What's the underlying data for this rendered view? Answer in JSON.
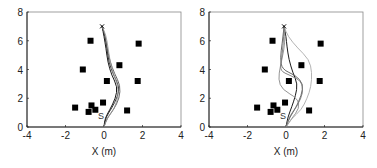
{
  "chart_data": [
    {
      "type": "scatter",
      "title": "",
      "xlabel": "X (m)",
      "ylabel": "",
      "xlim": [
        -4,
        4
      ],
      "ylim": [
        0,
        8
      ],
      "xticks": [
        -4,
        -2,
        0,
        2,
        4
      ],
      "yticks": [
        0,
        2,
        4,
        6,
        8
      ],
      "grid": false,
      "obstacles": [
        [
          -0.7,
          6.0
        ],
        [
          1.8,
          5.8
        ],
        [
          -1.1,
          4.0
        ],
        [
          0.8,
          4.3
        ],
        [
          0.15,
          3.2
        ],
        [
          1.75,
          3.2
        ],
        [
          -0.05,
          1.7
        ],
        [
          -0.65,
          1.5
        ],
        [
          -0.45,
          1.2
        ],
        [
          -1.5,
          1.35
        ],
        [
          -0.8,
          1.05
        ],
        [
          1.2,
          1.15
        ]
      ],
      "goal": {
        "marker": "x",
        "x": -0.1,
        "y": 7.0
      },
      "start": {
        "label": "S",
        "x": 0.0,
        "y": 0.8
      },
      "trajectories": [
        {
          "color": "#000000",
          "points": [
            [
              0,
              0
            ],
            [
              0.05,
              0.6
            ],
            [
              0.3,
              1.2
            ],
            [
              0.6,
              2.0
            ],
            [
              0.7,
              2.8
            ],
            [
              0.4,
              3.6
            ],
            [
              0.2,
              4.5
            ],
            [
              0.1,
              5.5
            ],
            [
              0,
              6.3
            ],
            [
              -0.1,
              7.0
            ]
          ]
        },
        {
          "color": "#222222",
          "points": [
            [
              0,
              0
            ],
            [
              0.1,
              0.7
            ],
            [
              0.4,
              1.3
            ],
            [
              0.7,
              2.1
            ],
            [
              0.8,
              2.8
            ],
            [
              0.5,
              3.6
            ],
            [
              0.25,
              4.5
            ],
            [
              0.15,
              5.5
            ],
            [
              0.05,
              6.3
            ],
            [
              -0.1,
              7.0
            ]
          ]
        },
        {
          "color": "#555555",
          "points": [
            [
              0,
              0
            ],
            [
              0.15,
              0.6
            ],
            [
              0.5,
              1.2
            ],
            [
              0.8,
              2.0
            ],
            [
              0.85,
              2.9
            ],
            [
              0.55,
              3.7
            ],
            [
              0.3,
              4.6
            ],
            [
              0.15,
              5.6
            ],
            [
              0.05,
              6.4
            ],
            [
              -0.1,
              7.0
            ]
          ]
        },
        {
          "color": "#999999",
          "points": [
            [
              0,
              0
            ],
            [
              0.2,
              0.7
            ],
            [
              0.55,
              1.3
            ],
            [
              0.75,
              2.2
            ],
            [
              0.7,
              3.0
            ],
            [
              0.45,
              3.8
            ],
            [
              0.3,
              4.7
            ],
            [
              0.2,
              5.6
            ],
            [
              0.1,
              6.4
            ],
            [
              -0.1,
              7.0
            ]
          ]
        }
      ]
    },
    {
      "type": "scatter",
      "title": "",
      "xlabel": "X (m)",
      "ylabel": "",
      "xlim": [
        -4,
        4
      ],
      "ylim": [
        0,
        8
      ],
      "xticks": [
        -4,
        -2,
        0,
        2,
        4
      ],
      "yticks": [
        0,
        2,
        4,
        6,
        8
      ],
      "grid": false,
      "obstacles": [
        [
          -0.7,
          6.0
        ],
        [
          1.8,
          5.8
        ],
        [
          -1.1,
          4.0
        ],
        [
          0.8,
          4.3
        ],
        [
          0.15,
          3.2
        ],
        [
          1.75,
          3.2
        ],
        [
          -0.05,
          1.7
        ],
        [
          -0.65,
          1.5
        ],
        [
          -0.45,
          1.2
        ],
        [
          -1.5,
          1.35
        ],
        [
          -0.8,
          1.05
        ],
        [
          1.2,
          1.15
        ]
      ],
      "goal": {
        "marker": "x",
        "x": -0.1,
        "y": 7.0
      },
      "start": {
        "label": "S",
        "x": 0.0,
        "y": 0.8
      },
      "trajectories": [
        {
          "color": "#000000",
          "points": [
            [
              0,
              0
            ],
            [
              0.1,
              0.7
            ],
            [
              0.3,
              1.4
            ],
            [
              0.5,
              2.2
            ],
            [
              0.6,
              3.0
            ],
            [
              0.35,
              3.8
            ],
            [
              0.15,
              4.7
            ],
            [
              0.05,
              5.6
            ],
            [
              0,
              6.3
            ],
            [
              -0.1,
              7.0
            ]
          ]
        },
        {
          "color": "#555555",
          "points": [
            [
              0,
              0
            ],
            [
              0.2,
              0.7
            ],
            [
              0.5,
              1.3
            ],
            [
              0.8,
              2.2
            ],
            [
              0.9,
              3.0
            ],
            [
              0.5,
              3.6
            ],
            [
              -0.2,
              4.0
            ],
            [
              -0.3,
              4.8
            ],
            [
              -0.2,
              5.8
            ],
            [
              -0.1,
              7.0
            ]
          ]
        },
        {
          "color": "#888888",
          "points": [
            [
              0,
              0
            ],
            [
              0.3,
              0.6
            ],
            [
              0.7,
              1.3
            ],
            [
              0.6,
              2.0
            ],
            [
              -0.2,
              2.6
            ],
            [
              -0.4,
              3.3
            ],
            [
              -0.3,
              4.2
            ],
            [
              -0.1,
              5.4
            ],
            [
              -0.05,
              6.3
            ],
            [
              -0.1,
              7.0
            ]
          ]
        },
        {
          "color": "#aaaaaa",
          "points": [
            [
              0,
              0
            ],
            [
              0.3,
              0.6
            ],
            [
              0.8,
              1.2
            ],
            [
              1.1,
              2.0
            ],
            [
              1.3,
              2.8
            ],
            [
              1.35,
              3.8
            ],
            [
              1.2,
              4.7
            ],
            [
              0.6,
              5.5
            ],
            [
              0.1,
              6.3
            ],
            [
              -0.1,
              7.0
            ]
          ]
        },
        {
          "color": "#777777",
          "points": [
            [
              0,
              0
            ],
            [
              0.2,
              0.8
            ],
            [
              0.6,
              1.5
            ],
            [
              0.9,
              2.4
            ],
            [
              0.8,
              3.2
            ],
            [
              0.2,
              3.6
            ],
            [
              -0.3,
              3.9
            ],
            [
              -0.25,
              4.6
            ],
            [
              -0.15,
              5.6
            ],
            [
              -0.1,
              7.0
            ]
          ]
        }
      ]
    }
  ]
}
